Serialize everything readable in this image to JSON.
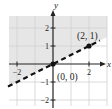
{
  "chart_data": {
    "type": "line",
    "title": "",
    "xlabel": "x",
    "ylabel": "y",
    "xlim": [
      -2.9,
      3.2
    ],
    "ylim": [
      -2.5,
      2.7
    ],
    "grid": true,
    "x_ticks": [
      -2,
      2
    ],
    "x_tick_labels": [
      "−2",
      "2"
    ],
    "y_ticks": [
      2,
      1,
      -1,
      -2
    ],
    "y_tick_labels": [
      "2",
      "1",
      "−1",
      "−2"
    ],
    "series": [
      {
        "name": "boundary y = x/2",
        "style": "dashed",
        "x": [
          -2.5,
          2.6
        ],
        "y": [
          -1.25,
          1.3
        ]
      }
    ],
    "shaded_region": "above boundary line (y > x/2)",
    "points": [
      {
        "label": "(0, 0)",
        "x": 0,
        "y": 0
      },
      {
        "label": "(2, 1)",
        "x": 2,
        "y": 1
      }
    ]
  },
  "colors": {
    "shade": "#e6e6e6",
    "grid": "#d0d0d0",
    "axis": "#222222",
    "line": "#111111",
    "point": "#111111"
  }
}
